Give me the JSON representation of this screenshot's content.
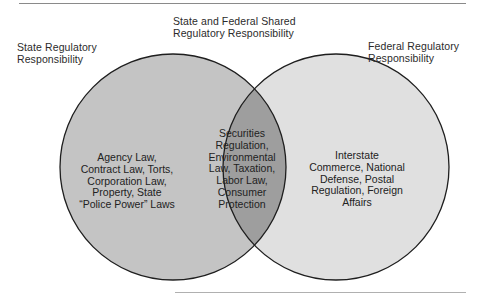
{
  "diagram": {
    "type": "venn",
    "colors": {
      "left_fill": "#c4c4c4",
      "right_fill": "#e0e0e0",
      "overlap_fill": "#9e9e9e",
      "outline": "#1e1e1e",
      "rule": "#8a8a8a"
    },
    "labels": {
      "left": [
        "State Regulatory",
        "Responsibility"
      ],
      "center": [
        "State and Federal Shared",
        "Regulatory Responsibility"
      ],
      "right": [
        "Federal Regulatory",
        "Responsibility"
      ]
    },
    "regions": {
      "left": [
        "Agency Law,",
        "Contract Law, Torts,",
        "Corporation Law,",
        "Property, State",
        "“Police Power” Laws"
      ],
      "middle": [
        "Securities",
        "Regulation,",
        "Environmental",
        "Law, Taxation,",
        "Labor Law,",
        "Consumer",
        "Protection"
      ],
      "right": [
        "Interstate",
        "Commerce, National",
        "Defense, Postal",
        "Regulation, Foreign",
        "Affairs"
      ]
    }
  }
}
